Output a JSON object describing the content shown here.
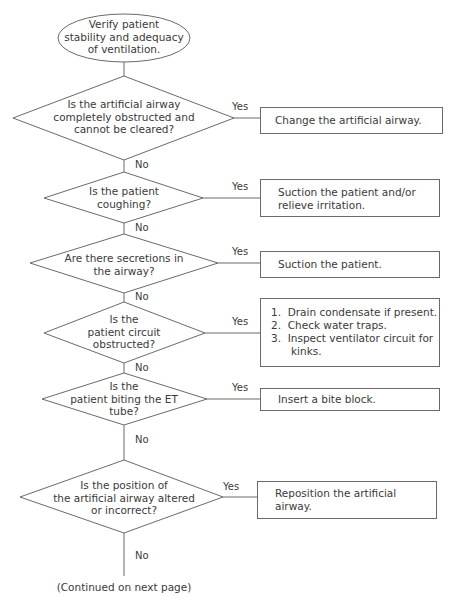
{
  "start": {
    "lines": [
      "Verify patient",
      "stability and adequacy",
      "of ventilation."
    ]
  },
  "labels": {
    "yes": "Yes",
    "no": "No"
  },
  "decisions": [
    {
      "lines": [
        "Is the artificial airway",
        "completely obstructed and",
        "cannot be cleared?"
      ]
    },
    {
      "lines": [
        "Is the patient",
        "coughing?"
      ]
    },
    {
      "lines": [
        "Are there secretions in",
        "the airway?"
      ]
    },
    {
      "lines": [
        "Is the",
        "patient circuit",
        "obstructed?"
      ]
    },
    {
      "lines": [
        "Is the",
        "patient biting the ET",
        "tube?"
      ]
    },
    {
      "lines": [
        "Is the position of",
        "the artificial airway altered",
        "or incorrect?"
      ]
    }
  ],
  "actions": [
    {
      "lines": [
        "Change the artificial airway."
      ]
    },
    {
      "lines": [
        "Suction the patient and/or",
        "relieve irritation."
      ]
    },
    {
      "lines": [
        "Suction the patient."
      ]
    },
    {
      "lines": [
        "1.  Drain condensate if present.",
        "2.  Check water traps.",
        "3.  Inspect ventilator circuit for",
        "      kinks."
      ]
    },
    {
      "lines": [
        "Insert a bite block."
      ]
    },
    {
      "lines": [
        "Reposition the artificial",
        "airway."
      ]
    }
  ],
  "footer": {
    "text": "(Continued on next page)"
  }
}
